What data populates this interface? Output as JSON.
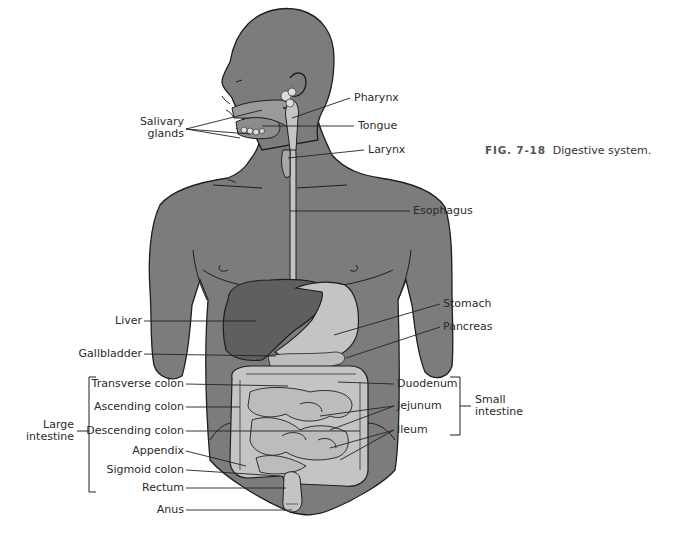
{
  "figure": {
    "number_prefix": "FIG.",
    "number": "7-18",
    "title": "Digestive system."
  },
  "colors": {
    "body": "#7c7c7c",
    "outline": "#1e1e1e",
    "organ_light": "#c4c4c4",
    "liver": "#5f5f5f",
    "leader_line": "#222222"
  },
  "labels": {
    "salivary_glands": {
      "line1": "Salivary",
      "line2": "glands"
    },
    "pharynx": "Pharynx",
    "tongue": "Tongue",
    "larynx": "Larynx",
    "esophagus": "Esophagus",
    "liver": "Liver",
    "stomach": "Stomach",
    "pancreas": "Pancreas",
    "gallbladder": "Gallbladder",
    "transverse_colon": "Transverse colon",
    "ascending_colon": "Ascending colon",
    "descending_colon": "Descending colon",
    "appendix": "Appendix",
    "sigmoid_colon": "Sigmoid colon",
    "rectum": "Rectum",
    "anus": "Anus",
    "duodenum": "Duodenum",
    "jejunum": "Jejunum",
    "ileum": "Ileum"
  },
  "groups": {
    "large_intestine": {
      "line1": "Large",
      "line2": "intestine"
    },
    "small_intestine": {
      "line1": "Small",
      "line2": "intestine"
    }
  }
}
